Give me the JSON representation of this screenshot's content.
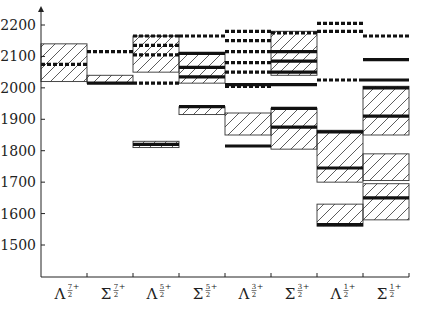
{
  "chart_data": {
    "type": "bar",
    "title": "",
    "xlabel": "",
    "ylabel": "",
    "ylim": [
      1400,
      2240
    ],
    "yticks": [
      1500,
      1600,
      1700,
      1800,
      1900,
      2000,
      2100,
      2200
    ],
    "categories": [
      {
        "base": "Λ",
        "sup": "7/2+"
      },
      {
        "base": "Σ",
        "sup": "7/2+"
      },
      {
        "base": "Λ",
        "sup": "5/2+"
      },
      {
        "base": "Σ",
        "sup": "5/2+"
      },
      {
        "base": "Λ",
        "sup": "3/2+"
      },
      {
        "base": "Σ",
        "sup": "3/2+"
      },
      {
        "base": "Λ",
        "sup": "1/2+"
      },
      {
        "base": "Σ",
        "sup": "1/2+"
      }
    ],
    "bands": [
      {
        "col": 0,
        "low": 2020,
        "high": 2140
      },
      {
        "col": 1,
        "low": 2015,
        "high": 2040
      },
      {
        "col": 2,
        "low": 1810,
        "high": 1830
      },
      {
        "col": 2,
        "low": 2050,
        "high": 2165
      },
      {
        "col": 3,
        "low": 1915,
        "high": 1940
      },
      {
        "col": 3,
        "low": 2015,
        "high": 2110
      },
      {
        "col": 4,
        "low": 1850,
        "high": 1920
      },
      {
        "col": 5,
        "low": 1805,
        "high": 1935
      },
      {
        "col": 5,
        "low": 2040,
        "high": 2180
      },
      {
        "col": 6,
        "low": 1700,
        "high": 1865
      },
      {
        "col": 6,
        "low": 1560,
        "high": 1630
      },
      {
        "col": 7,
        "low": 1850,
        "high": 2005
      },
      {
        "col": 7,
        "low": 1705,
        "high": 1790
      },
      {
        "col": 7,
        "low": 1580,
        "high": 1695
      }
    ],
    "solid_levels": [
      {
        "col": 1,
        "value": 2015
      },
      {
        "col": 2,
        "value": 1820
      },
      {
        "col": 3,
        "value": 1940
      },
      {
        "col": 3,
        "value": 2035
      },
      {
        "col": 3,
        "value": 2065
      },
      {
        "col": 3,
        "value": 2110
      },
      {
        "col": 4,
        "value": 1815
      },
      {
        "col": 4,
        "value": 2010
      },
      {
        "col": 5,
        "value": 1875
      },
      {
        "col": 5,
        "value": 1935
      },
      {
        "col": 5,
        "value": 2010
      },
      {
        "col": 5,
        "value": 2050
      },
      {
        "col": 5,
        "value": 2085
      },
      {
        "col": 5,
        "value": 2115
      },
      {
        "col": 6,
        "value": 1745
      },
      {
        "col": 6,
        "value": 1860
      },
      {
        "col": 6,
        "value": 1565
      },
      {
        "col": 7,
        "value": 1910
      },
      {
        "col": 7,
        "value": 2000
      },
      {
        "col": 7,
        "value": 2025
      },
      {
        "col": 7,
        "value": 2090
      },
      {
        "col": 7,
        "value": 1650
      }
    ],
    "dashed_levels": [
      {
        "col": 0,
        "value": 2075
      },
      {
        "col": 1,
        "value": 2115
      },
      {
        "col": 2,
        "value": 2015
      },
      {
        "col": 2,
        "value": 2105
      },
      {
        "col": 2,
        "value": 2135
      },
      {
        "col": 2,
        "value": 2165
      },
      {
        "col": 3,
        "value": 2165
      },
      {
        "col": 4,
        "value": 2005
      },
      {
        "col": 4,
        "value": 2050
      },
      {
        "col": 4,
        "value": 2080
      },
      {
        "col": 4,
        "value": 2115
      },
      {
        "col": 4,
        "value": 2150
      },
      {
        "col": 4,
        "value": 2180
      },
      {
        "col": 5,
        "value": 2175
      },
      {
        "col": 6,
        "value": 2025
      },
      {
        "col": 6,
        "value": 2180
      },
      {
        "col": 6,
        "value": 2205
      },
      {
        "col": 7,
        "value": 2165
      }
    ],
    "grid": false,
    "legend": null
  },
  "layout": {
    "plot_left": 41,
    "plot_right": 409,
    "y_top_value": 2200,
    "y_top_px": 25,
    "y_bottom_value": 1500,
    "y_bottom_px": 245,
    "axis_bottom_px": 277,
    "axis_top_px": 6
  }
}
